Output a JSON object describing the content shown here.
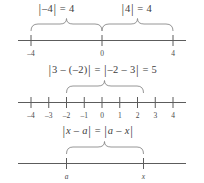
{
  "figure": {
    "line_color": "#5c5c5c",
    "brace_color": "#8a8a8a",
    "text_color": "#3d3d3d",
    "background": "#ffffff"
  },
  "panels": [
    {
      "id": "panel-1",
      "axis_min": -5.2,
      "axis_max": 5.2,
      "ticks": [
        {
          "value": -4,
          "label": "–4"
        },
        {
          "value": 0,
          "label": "0"
        },
        {
          "value": 4,
          "label": "4"
        }
      ],
      "equations": [
        {
          "id": "eq-left",
          "text": "|–4| = 4",
          "lhs": "–4",
          "rhs": "4",
          "center_value": -2
        },
        {
          "id": "eq-right",
          "text": "|4| = 4",
          "lhs": "4",
          "rhs": "4",
          "center_value": 2
        }
      ],
      "braces": [
        {
          "id": "brace-left",
          "from": -4,
          "to": 0
        },
        {
          "id": "brace-right",
          "from": 0,
          "to": 4
        }
      ]
    },
    {
      "id": "panel-2",
      "axis_min": -5.2,
      "axis_max": 5.2,
      "ticks": [
        {
          "value": -4,
          "label": "–4"
        },
        {
          "value": -3,
          "label": "–3"
        },
        {
          "value": -2,
          "label": "–2"
        },
        {
          "value": -1,
          "label": "–1"
        },
        {
          "value": 0,
          "label": "0"
        },
        {
          "value": 1,
          "label": "1"
        },
        {
          "value": 2,
          "label": "2"
        },
        {
          "value": 3,
          "label": "3"
        },
        {
          "value": 4,
          "label": "4"
        }
      ],
      "equations": [
        {
          "id": "eq-distance",
          "text": "|3 – (–2)| = |–2 – 3| = 5",
          "center_value": 0.5
        }
      ],
      "braces": [
        {
          "id": "brace-distance",
          "from": -2,
          "to": 3
        }
      ]
    },
    {
      "id": "panel-3",
      "axis_min": -5.2,
      "axis_max": 5.2,
      "ticks": [
        {
          "value": -2,
          "label": "a",
          "italic": true
        },
        {
          "value": 3,
          "label": "x",
          "italic": true
        }
      ],
      "equations": [
        {
          "id": "eq-symmetry",
          "text": "|x – a| = |a – x|",
          "center_value": 0.5
        }
      ],
      "braces": [
        {
          "id": "brace-symmetry",
          "from": -2,
          "to": 3
        }
      ]
    }
  ],
  "equation_parts": {
    "abs_bar": "|",
    "equals": "=",
    "minus": "–",
    "panel1_left": {
      "inner": "–4",
      "result": "4"
    },
    "panel1_right": {
      "inner": "4",
      "result": "4"
    },
    "panel2": {
      "first": "3 – (–2)",
      "second": "–2 – 3",
      "result": "5"
    },
    "panel3": {
      "first": "x – a",
      "second": "a – x"
    }
  }
}
